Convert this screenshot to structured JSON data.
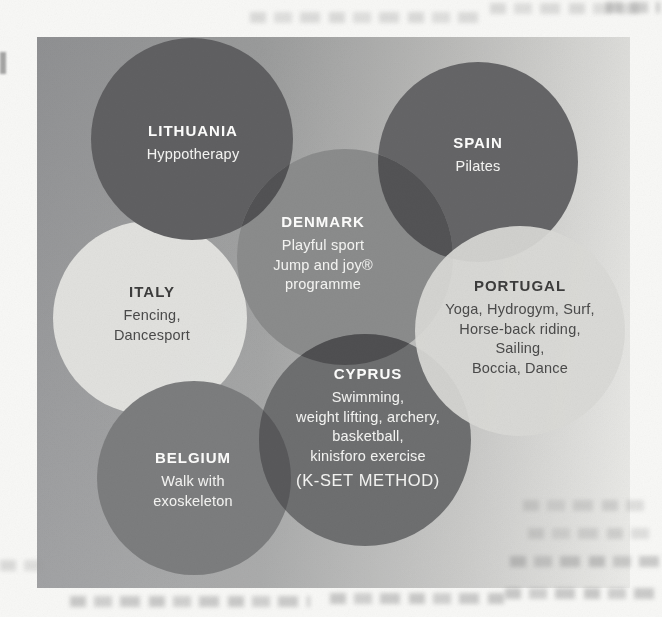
{
  "figure": {
    "description": "Overlapping circles diagram of countries and adapted sport activities",
    "panel_gradient": [
      "#97989a",
      "#a2a3a3",
      "#c6c6c4",
      "#e9e9e6"
    ],
    "overlap_colors": {
      "denmark_lithuania": "#525254",
      "denmark_spain": "#535355",
      "cyprus_denmark": "#4f4f51",
      "cyprus_belgium": "#59595b"
    },
    "circles": [
      {
        "country": "LITHUANIA",
        "activities": [
          "Hyppotherapy"
        ],
        "fill": "#606062",
        "text_color": "#f2f2f0"
      },
      {
        "country": "SPAIN",
        "activities": [
          "Pilates"
        ],
        "fill": "#656567",
        "text_color": "#f2f2f0"
      },
      {
        "country": "DENMARK",
        "activities": [
          "Playful sport",
          "Jump and joy®",
          "programme"
        ],
        "fill": "#8b8c8c",
        "text_color": "#f6f6f4"
      },
      {
        "country": "ITALY",
        "activities": [
          "Fencing,",
          "Dancesport"
        ],
        "fill": "#e4e4e1",
        "text_color": "#454545"
      },
      {
        "country": "PORTUGAL",
        "activities": [
          "Yoga, Hydrogym, Surf,",
          "Horse-back riding,",
          "Sailing,",
          "Boccia, Dance"
        ],
        "fill": "#d9d9d6",
        "text_color": "#454545"
      },
      {
        "country": "CYPRUS",
        "activities": [
          "Swimming,",
          "weight lifting, archery,",
          "basketball,",
          "kinisforo exercise"
        ],
        "method": "(K-SET METHOD)",
        "fill": "#6e6f70",
        "text_color": "#f2f2f0"
      },
      {
        "country": "BELGIUM",
        "activities": [
          "Walk with",
          "exoskeleton"
        ],
        "fill": "#7c7d7e",
        "text_color": "#f2f2f0"
      }
    ]
  }
}
